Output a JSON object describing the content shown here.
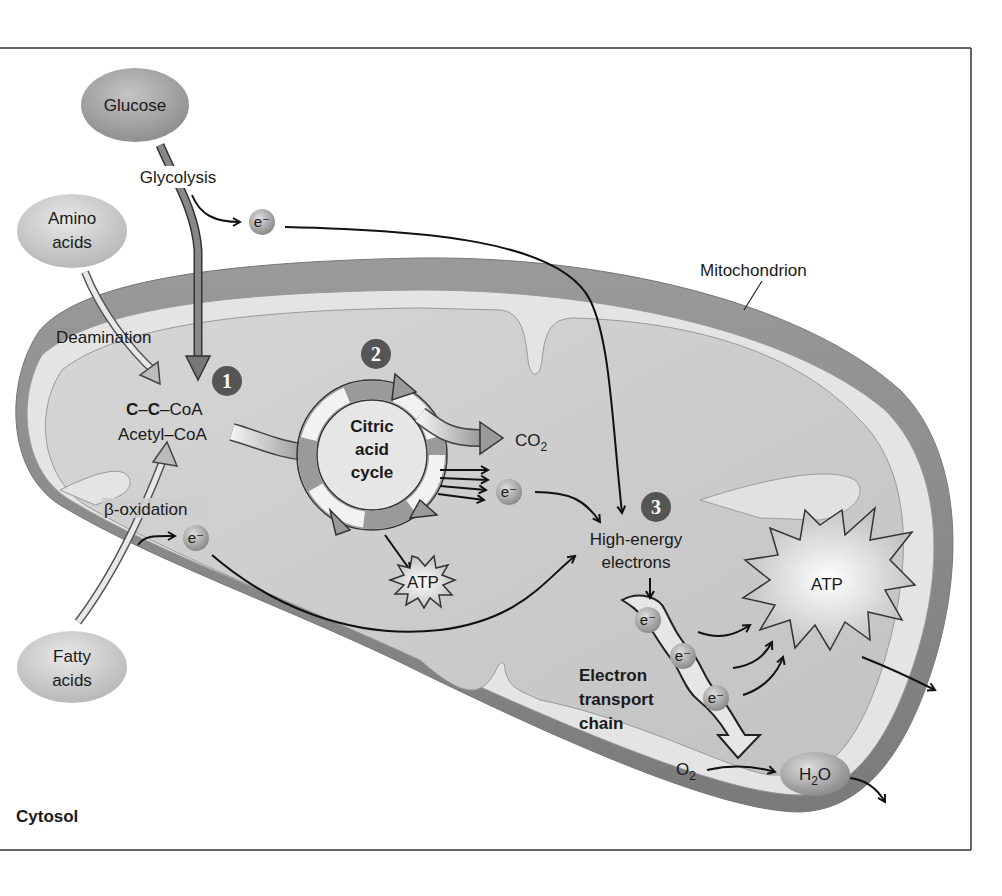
{
  "diagram": {
    "regions": {
      "cytosol": "Cytosol",
      "organelle": "Mitochondrion"
    },
    "inputs": {
      "glucose": "Glucose",
      "amino_acids_line1": "Amino",
      "amino_acids_line2": "acids",
      "fatty_acids_line1": "Fatty",
      "fatty_acids_line2": "acids"
    },
    "processes": {
      "glycolysis": "Glycolysis",
      "deamination": "Deamination",
      "beta_oxidation": "β-oxidation",
      "citric_line1": "Citric",
      "citric_line2": "acid",
      "citric_line3": "cycle",
      "etc_line1": "Electron",
      "etc_line2": "transport",
      "etc_line3": "chain"
    },
    "molecules": {
      "acetyl_formula_c1": "C",
      "acetyl_formula_dash1": "–",
      "acetyl_formula_c2": "C",
      "acetyl_formula_rest": "–CoA",
      "acetyl_name": "Acetyl–CoA",
      "co2_main": "CO",
      "co2_sub": "2",
      "electron": "e⁻",
      "atp": "ATP",
      "high_energy_line1": "High-energy",
      "high_energy_line2": "electrons",
      "o2_main": "O",
      "o2_sub": "2",
      "h2o_h": "H",
      "h2o_sub": "2",
      "h2o_o": "O"
    },
    "steps": [
      {
        "number": "1"
      },
      {
        "number": "2"
      },
      {
        "number": "3"
      }
    ],
    "colors": {
      "outer_membrane": "#8a8a8a",
      "intermembrane": "#e4e4e4",
      "matrix": "#c8c8c8",
      "badge": "#555555",
      "frame": "#333333"
    }
  }
}
